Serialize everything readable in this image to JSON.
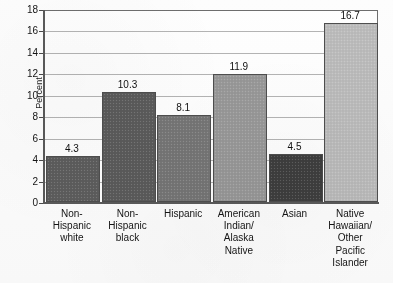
{
  "chart_data": {
    "type": "bar",
    "title": "",
    "xlabel": "",
    "ylabel": "Percent",
    "ylim": [
      0,
      18
    ],
    "ytick_step": 2,
    "yticks": [
      "18",
      "16",
      "14",
      "12",
      "10",
      "8",
      "6",
      "4",
      "2",
      "0"
    ],
    "grid": true,
    "legend": "none",
    "categories": [
      "Non-Hispanic white",
      "Non-Hispanic black",
      "Hispanic",
      "American Indian/ Alaska Native",
      "Asian",
      "Native Hawaiian/ Other Pacific Islander"
    ],
    "category_lines": [
      [
        "Non-",
        "Hispanic",
        "white"
      ],
      [
        "Non-",
        "Hispanic",
        "black"
      ],
      [
        "Hispanic"
      ],
      [
        "American",
        "Indian/",
        "Alaska",
        "Native"
      ],
      [
        "Asian"
      ],
      [
        "Native",
        "Hawaiian/",
        "Other",
        "Pacific",
        "Islander"
      ]
    ],
    "values": [
      4.3,
      10.3,
      8.1,
      11.9,
      4.5,
      16.7
    ],
    "value_labels": [
      "4.3",
      "10.3",
      "8.1",
      "11.9",
      "4.5",
      "16.7"
    ],
    "bar_colors": [
      "#5e5e5e",
      "#5c5c5c",
      "#777777",
      "#9a9a9a",
      "#3f3f3f",
      "#bdbdbd"
    ]
  },
  "axis": {
    "y_label": "Percent"
  }
}
